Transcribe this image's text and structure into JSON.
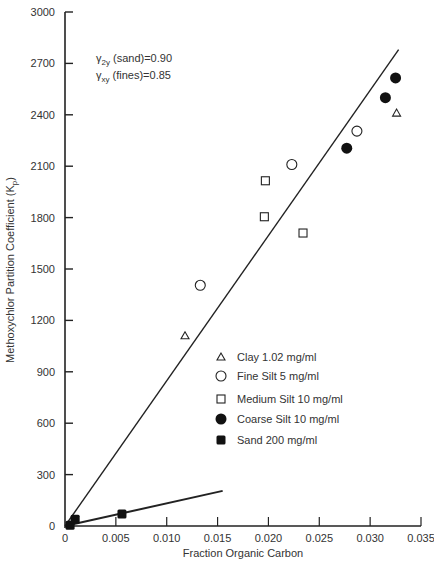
{
  "chart_data": {
    "type": "scatter",
    "title": "",
    "xlabel": "Fraction Organic Carbon",
    "ylabel": "Methoxychlor Partition Coefficient (Kp)",
    "ylabel_main": "Methoxychlor Partition Coefficient (K",
    "ylabel_sub": "p",
    "ylabel_end": ")",
    "xlim": [
      0,
      0.035
    ],
    "ylim": [
      0,
      3000
    ],
    "xticks": [
      0,
      0.005,
      0.01,
      0.015,
      0.02,
      0.025,
      0.03,
      0.035
    ],
    "xtick_labels": [
      "0",
      "0.005",
      "0.010",
      "0.015",
      "0.020",
      "0.025",
      "0.030",
      "0.035"
    ],
    "yticks": [
      0,
      300,
      600,
      900,
      1200,
      1500,
      1800,
      2100,
      2400,
      2700,
      3000
    ],
    "ytick_labels": [
      "0",
      "300",
      "600",
      "900",
      "1200",
      "1500",
      "1800",
      "2100",
      "2400",
      "2700",
      "3000"
    ],
    "grid": false,
    "legend_position": "lower-right-inside",
    "annotations": [
      {
        "symbol": "γ",
        "sub": "2y",
        "text": " (sand)=0.90"
      },
      {
        "symbol": "γ",
        "sub": "xy",
        "text": " (fines)=0.85"
      }
    ],
    "series": [
      {
        "name": "Clay 1.02 mg/ml",
        "marker": "triangle-open",
        "x": [
          0.0118,
          0.0326
        ],
        "y": [
          1110,
          2410
        ]
      },
      {
        "name": "Fine Silt 5 mg/ml",
        "marker": "circle-open",
        "x": [
          0.0133,
          0.0223,
          0.0287
        ],
        "y": [
          1405,
          2110,
          2305
        ]
      },
      {
        "name": "Medium Silt 10 mg/ml",
        "marker": "square-open",
        "x": [
          0.0197,
          0.0196,
          0.0234
        ],
        "y": [
          2015,
          1805,
          1710
        ]
      },
      {
        "name": "Coarse Silt 10 mg/ml",
        "marker": "circle-filled",
        "x": [
          0.0277,
          0.0315,
          0.0325
        ],
        "y": [
          2205,
          2500,
          2615
        ]
      },
      {
        "name": "Sand 200 mg/ml",
        "marker": "square-filled",
        "x": [
          0.0005,
          0.001,
          0.0056
        ],
        "y": [
          5,
          40,
          70
        ]
      }
    ],
    "fit_lines": [
      {
        "name": "fines regression",
        "x": [
          0,
          0.0328
        ],
        "y": [
          0,
          2780
        ]
      },
      {
        "name": "sand regression",
        "x": [
          0,
          0.0155
        ],
        "y": [
          0,
          205
        ]
      }
    ]
  }
}
